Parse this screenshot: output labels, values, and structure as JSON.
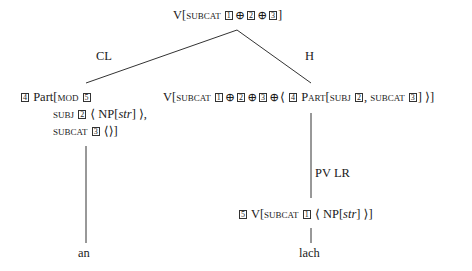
{
  "root": {
    "category": "V",
    "feature": "subcat",
    "tags": [
      "1",
      "2",
      "3"
    ],
    "operator": "⊕"
  },
  "edges": {
    "left_label": "CL",
    "right_label": "H",
    "unary_label": "PV LR"
  },
  "left_child": {
    "tag": "4",
    "category": "Part",
    "mod_feature": "mod",
    "mod_tag": "5",
    "subj_feature": "subj",
    "subj_tag": "2",
    "subj_np": "NP",
    "subj_case": "str",
    "subcat_feature": "subcat",
    "subcat_tag": "3",
    "subcat_value": "⟨⟩",
    "word": "an"
  },
  "right_child": {
    "category": "V",
    "feature": "subcat",
    "tags": [
      "1",
      "2",
      "3"
    ],
    "operator": "⊕",
    "inner_tag": "4",
    "inner_category": "Part",
    "inner_subj_feature": "subj",
    "inner_subj_tag": "2",
    "inner_subcat_feature": "subcat",
    "inner_subcat_tag": "3"
  },
  "lexical": {
    "tag": "5",
    "category": "V",
    "feature": "subcat",
    "subcat_tag": "1",
    "np": "NP",
    "case": "str",
    "word": "lach"
  }
}
